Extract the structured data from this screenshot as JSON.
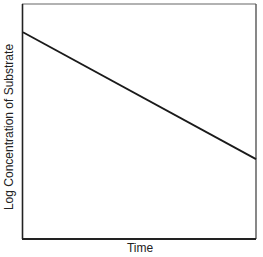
{
  "chart_data": {
    "type": "line",
    "title": "",
    "xlabel": "Time",
    "ylabel": "Log Concentration of Substrate",
    "grid": false,
    "legend": null,
    "x_ticks": [],
    "y_ticks": [],
    "xlim": [
      0,
      1
    ],
    "ylim": [
      0,
      1
    ],
    "series": [
      {
        "name": "log [S] vs time",
        "x": [
          0,
          1
        ],
        "y": [
          0.88,
          0.34
        ]
      }
    ],
    "colors": {
      "frame": "#333333",
      "line": "#1a1a1a"
    }
  },
  "labels": {
    "x": "Time",
    "y": "Log Concentration of Substrate"
  }
}
